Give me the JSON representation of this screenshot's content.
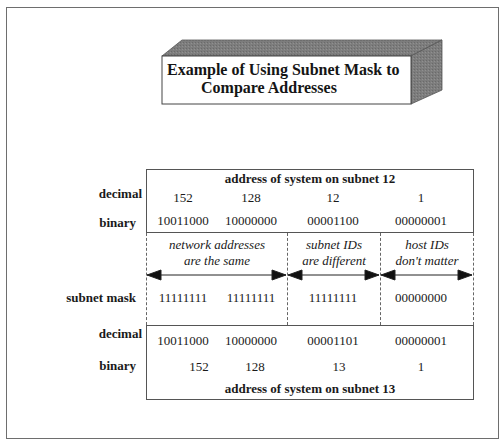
{
  "title": {
    "line1": "Example of Using Subnet Mask to",
    "line2": "Compare Addresses"
  },
  "top_table": {
    "header": "address of system on subnet 12",
    "rows": [
      {
        "label": "decimal",
        "values": [
          "152",
          "128",
          "12",
          "1"
        ]
      },
      {
        "label": "binary",
        "values": [
          "10011000",
          "10000000",
          "00001100",
          "00000001"
        ]
      }
    ]
  },
  "annotations": [
    {
      "line1": "network addresses",
      "line2": "are the same"
    },
    {
      "line1": "subnet IDs",
      "line2": "are different"
    },
    {
      "line1": "host IDs",
      "line2": "don't matter"
    }
  ],
  "mask_row": {
    "label": "subnet mask",
    "values": [
      "11111111",
      "11111111",
      "11111111",
      "00000000"
    ]
  },
  "bottom_table": {
    "rows": [
      {
        "label": "decimal",
        "values": [
          "10011000",
          "10000000",
          "00001101",
          "00000001"
        ]
      },
      {
        "label": "binary",
        "values": [
          "152",
          "128",
          "13",
          "1"
        ]
      }
    ],
    "footer": "address of system on subnet 13"
  },
  "colors": {
    "line": "#555555",
    "title_box_shade": "#7a7a7a",
    "frame": "#6e6e6e"
  }
}
